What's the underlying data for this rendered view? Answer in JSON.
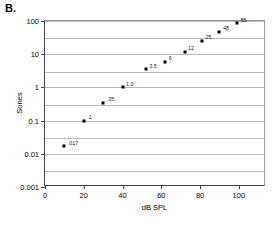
{
  "panel": {
    "label": "B."
  },
  "chart_data": {
    "type": "scatter",
    "title": "",
    "xlabel": "dB SPL",
    "ylabel": "Sones",
    "xlim": [
      0,
      114
    ],
    "ylim": [
      0.001,
      100
    ],
    "yscale": "log",
    "grid": true,
    "legend": false,
    "xticks": [
      0,
      20,
      40,
      60,
      80,
      100
    ],
    "xticklabels": [
      "0",
      "20",
      "40",
      "60",
      "80",
      "100"
    ],
    "yticks": [
      0.001,
      0.01,
      0.1,
      1,
      10,
      100
    ],
    "yticklabels": [
      "0.001",
      "0.01",
      "0.1",
      "1",
      "10",
      "100"
    ],
    "gridline_values": [
      0.003,
      0.01,
      0.03,
      0.1,
      0.3,
      1,
      3,
      10,
      30,
      100
    ],
    "x": [
      10,
      20,
      30,
      40,
      52,
      62,
      72,
      81,
      90,
      99
    ],
    "y": [
      0.017,
      0.1,
      0.35,
      1.0,
      3.5,
      6,
      12,
      25,
      48,
      85
    ],
    "point_labels": [
      ".017",
      ".1",
      ".35",
      "1.0",
      "3.5",
      "6",
      "12",
      "25",
      "48",
      "85"
    ]
  }
}
